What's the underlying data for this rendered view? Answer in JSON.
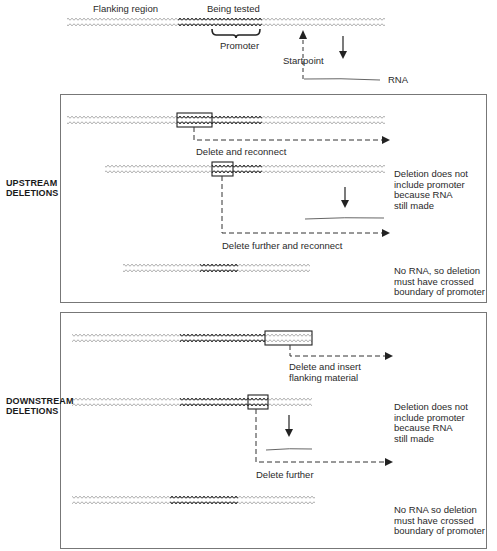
{
  "figure": {
    "colors": {
      "helix_light": "#a8a8a8",
      "helix_dark": "#3a3a3a",
      "line": "#333333",
      "panel_border": "#777777",
      "rna": "#555555"
    }
  },
  "overview": {
    "flanking_label": "Flanking region",
    "tested_label": "Being tested",
    "promoter_label": "Promoter",
    "startpoint_label": "Startpoint",
    "rna_label": "RNA",
    "icons": [
      "startpoint-up-arrow-icon",
      "transcription-down-arrow-icon",
      "promoter-brace-icon"
    ]
  },
  "upstream": {
    "heading": "UPSTREAM\nDELETIONS",
    "heading_line1": "UPSTREAM",
    "heading_line2": "DELETIONS",
    "rows": [
      {
        "step_label": "Delete and reconnect",
        "result_note": ""
      },
      {
        "step_label": "Delete further and reconnect",
        "result_note": "Deletion does not\ninclude promoter\nbecause RNA\nstill made",
        "rna_made": true
      },
      {
        "step_label": "",
        "result_note": "No RNA, so deletion\nmust have crossed\nboundary of promoter",
        "rna_made": false
      }
    ]
  },
  "downstream": {
    "heading_line1": "DOWNSTREAM",
    "heading_line2": "DELETIONS",
    "rows": [
      {
        "step_label_line1": "Delete and insert",
        "step_label_line2": "flanking material",
        "result_note": ""
      },
      {
        "step_label": "Delete further",
        "result_note": "Deletion does not\ninclude promoter\nbecause RNA\nstill made",
        "rna_made": true
      },
      {
        "step_label": "",
        "result_note": "No RNA so deletion\nmust have crossed\nboundary of promoter",
        "rna_made": false
      }
    ]
  }
}
